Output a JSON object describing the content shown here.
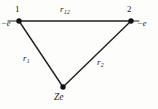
{
  "figure": {
    "type": "geometry-diagram",
    "background_color": "#fdfdfc",
    "line_color": "#1f1f1f",
    "text_color": "#1a1a1a",
    "vertices": [
      {
        "id": "vertex-1",
        "number_label": "1",
        "charge_label": "−e",
        "x": 19,
        "y": 21
      },
      {
        "id": "vertex-2",
        "number_label": "2",
        "charge_label": "−e",
        "x": 131,
        "y": 21
      },
      {
        "id": "vertex-nucleus",
        "number_label": "",
        "charge_label": "Ze",
        "x": 63,
        "y": 87
      }
    ],
    "edges": [
      {
        "id": "edge-r12",
        "label": "r",
        "subscript": "12",
        "from": "vertex-1",
        "to": "vertex-2"
      },
      {
        "id": "edge-r1",
        "label": "r",
        "subscript": "1",
        "from": "vertex-1",
        "to": "vertex-nucleus"
      },
      {
        "id": "edge-r2",
        "label": "r",
        "subscript": "2",
        "from": "vertex-2",
        "to": "vertex-nucleus"
      }
    ],
    "nucleus_label": "Ze"
  }
}
